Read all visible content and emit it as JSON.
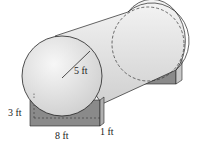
{
  "diagram": {
    "labels": {
      "radius": "5 ft",
      "support_height": "3 ft",
      "support_length": "8 ft",
      "support_width": "1 ft"
    },
    "colors": {
      "tank_fill": "#e6e6e6",
      "tank_shade": "#d2d2d2",
      "support_fill": "#8a8a8a",
      "support_side": "#a8a8a8",
      "stroke": "#222222"
    }
  }
}
